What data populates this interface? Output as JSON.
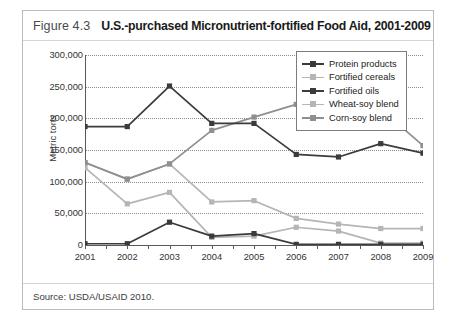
{
  "figure": {
    "number": "Figure 4.3",
    "title": "U.S.-purchased Micronutrient-fortified Food Aid, 2001-2009",
    "source": "Source: USDA/USAID 2010."
  },
  "colors": {
    "dark_series": "#3b3b3b",
    "mid_gray_series": "#8d8f91",
    "light_gray_series": "#b3b5b7",
    "axis": "#58595b",
    "gridline": "#8a8c8e",
    "card_border": "#b9bbbd",
    "background": "#ffffff"
  },
  "chart_data": {
    "type": "line",
    "title": "U.S.-purchased Micronutrient-fortified Food Aid, 2001-2009",
    "xlabel": "",
    "ylabel": "Metric tons",
    "categories": [
      "2001",
      "2002",
      "2003",
      "2004",
      "2005",
      "2006",
      "2007",
      "2008",
      "2009"
    ],
    "ylim": [
      0,
      300000
    ],
    "yticks": [
      "0",
      "50,000",
      "100,000",
      "150,000",
      "200,000",
      "250,000",
      "300,000"
    ],
    "ytick_values": [
      0,
      50000,
      100000,
      150000,
      200000,
      250000,
      300000
    ],
    "grid": true,
    "legend_position": "top-right",
    "series": [
      {
        "name": "Protein products",
        "color": "#3b3b3b",
        "marker": "square",
        "values": [
          187000,
          187000,
          251000,
          192000,
          192000,
          143000,
          139000,
          160000,
          145000
        ]
      },
      {
        "name": "Fortified cereals",
        "color": "#b3b5b7",
        "marker": "square",
        "values": [
          130000,
          104000,
          128000,
          68000,
          70000,
          42000,
          33000,
          26000,
          26000
        ]
      },
      {
        "name": "Fortified oils",
        "color": "#3b3b3b",
        "marker": "square",
        "values": [
          2000,
          2000,
          36000,
          14000,
          18000,
          1000,
          1000,
          1000,
          1000
        ]
      },
      {
        "name": "Wheat-soy blend",
        "color": "#b3b5b7",
        "marker": "square",
        "values": [
          122000,
          65000,
          83000,
          12000,
          14000,
          28000,
          22000,
          3000,
          3000
        ]
      },
      {
        "name": "Corn-soy blend",
        "color": "#8d8f91",
        "marker": "square",
        "values": [
          130000,
          104000,
          128000,
          181000,
          202000,
          222000,
          237000,
          215000,
          157000
        ]
      }
    ]
  }
}
